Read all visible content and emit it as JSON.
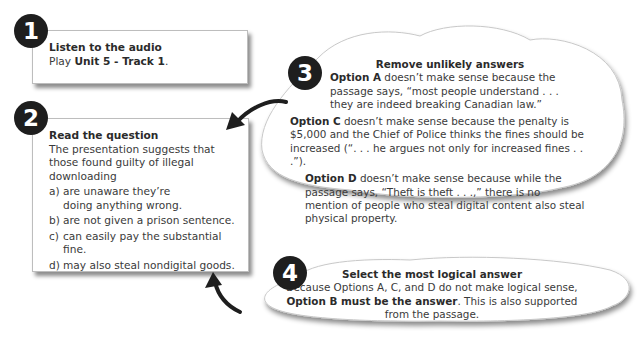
{
  "steps": [
    {
      "number": "1",
      "title": "Listen to the audio",
      "text_prefix": "Play ",
      "text_bold": "Unit 5 - Track 1",
      "text_suffix": "."
    },
    {
      "number": "2",
      "title": "Read the question",
      "question": "The presentation suggests that those found guilty of illegal downloading",
      "options": [
        {
          "letter": "a)",
          "text": "are unaware they’re doing anything wrong."
        },
        {
          "letter": "b)",
          "text": "are not given a prison sentence."
        },
        {
          "letter": "c)",
          "text": "can easily pay the substantial fine."
        },
        {
          "letter": "d)",
          "text": "may also steal nondigital goods."
        }
      ]
    },
    {
      "number": "3",
      "title": "Remove unlikely answers",
      "reasons": [
        {
          "label": "Option A",
          "text": " doesn’t make sense because the passage says, “most people understand . . . they are indeed breaking Canadian law.”"
        },
        {
          "label": "Option C",
          "text": " doesn’t make sense because the penalty is $5,000 and the Chief of Police thinks the fines should be increased (“. . . he argues not only for increased fines . . .”)."
        },
        {
          "label": "Option D",
          "text": " doesn’t make sense because while the passage says, “Theft is theft . . .,” there is no mention of people who steal digital content also steal physical property."
        }
      ]
    },
    {
      "number": "4",
      "title": "Select the most logical answer",
      "text_prefix": "Because Options A, C, and D do not make logical sense, ",
      "text_bold": "Option B must be the answer",
      "text_suffix": ". This is also supported from the passage."
    }
  ],
  "colors": {
    "badge": "#1e1e1e",
    "text": "#3a3a3a",
    "border": "#bdbdbd"
  }
}
